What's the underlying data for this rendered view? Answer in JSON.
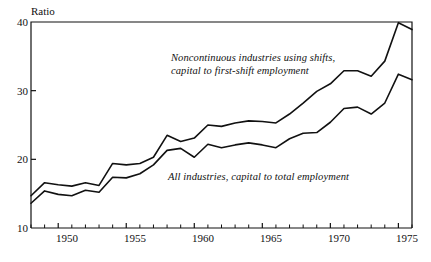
{
  "chart_data": {
    "type": "line",
    "title": "",
    "xlabel": "",
    "ylabel": "Ratio",
    "ylim": [
      10,
      40
    ],
    "xlim": [
      1948,
      1976
    ],
    "yticks": [
      10,
      20,
      30,
      40
    ],
    "ytick_labels": [
      "10",
      "20",
      "30",
      "40"
    ],
    "xticks": [
      1948,
      1949,
      1950,
      1951,
      1952,
      1953,
      1954,
      1955,
      1956,
      1957,
      1958,
      1959,
      1960,
      1961,
      1962,
      1963,
      1964,
      1965,
      1966,
      1967,
      1968,
      1969,
      1970,
      1971,
      1972,
      1973,
      1974,
      1975,
      1976
    ],
    "xtick_labels_shown": [
      "1950",
      "1955",
      "1960",
      "1965",
      "1970",
      "1975"
    ],
    "xtick_labels_shown_values": [
      1950,
      1955,
      1960,
      1965,
      1970,
      1975
    ],
    "grid": false,
    "legend_position": "inline-annotations",
    "x": [
      1948,
      1949,
      1950,
      1951,
      1952,
      1953,
      1954,
      1955,
      1956,
      1957,
      1958,
      1959,
      1960,
      1961,
      1962,
      1963,
      1964,
      1965,
      1966,
      1967,
      1968,
      1969,
      1970,
      1971,
      1972,
      1973,
      1974,
      1975,
      1976
    ],
    "series": [
      {
        "name": "Noncontinuous industries using shifts, capital to first-shift employment",
        "values": [
          14.7,
          16.6,
          16.3,
          16.1,
          16.6,
          16.2,
          19.4,
          19.2,
          19.4,
          20.3,
          23.5,
          22.6,
          23.1,
          25.0,
          24.8,
          25.3,
          25.6,
          25.5,
          25.3,
          26.6,
          28.2,
          29.9,
          31.0,
          32.9,
          32.9,
          32.1,
          34.3,
          39.9,
          38.9
        ]
      },
      {
        "name": "All industries, capital to total employment",
        "values": [
          13.6,
          15.4,
          14.9,
          14.7,
          15.5,
          15.2,
          17.4,
          17.3,
          17.9,
          19.2,
          21.3,
          21.6,
          20.3,
          22.2,
          21.7,
          22.1,
          22.4,
          22.1,
          21.7,
          23.0,
          23.8,
          23.9,
          25.4,
          27.4,
          27.6,
          26.6,
          28.2,
          32.4,
          31.6
        ]
      }
    ],
    "annotations": [
      {
        "id": "upper-series-annotation",
        "text": "Noncontinuous industries using shifts,\ncapital to first-shift employment",
        "for_series": 0
      },
      {
        "id": "lower-series-annotation",
        "text": "All industries, capital to total employment",
        "for_series": 1
      }
    ],
    "colors": {
      "line": "#111111",
      "axis": "#111111",
      "background": "#ffffff"
    }
  }
}
